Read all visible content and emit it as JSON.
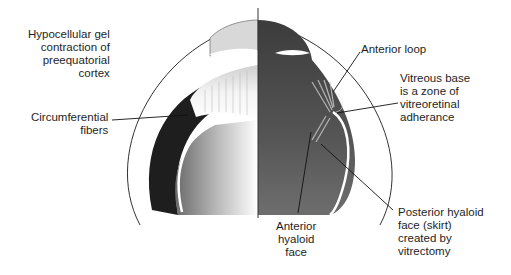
{
  "figure": {
    "colors": {
      "background": "#ffffff",
      "light_half": "#e6e6e6",
      "dark_half": "#4a4a4a",
      "outline": "#333333",
      "leader_line": "#111111"
    }
  },
  "labels": {
    "hypocellular": {
      "lines": [
        "Hypocellular gel",
        "contraction of",
        "preequatorial",
        "cortex"
      ]
    },
    "circumferential": {
      "lines": [
        "Circumferential",
        "fibers"
      ]
    },
    "anterior_loop": {
      "lines": [
        "Anterior loop"
      ]
    },
    "vitreous_base": {
      "lines": [
        "Vitreous base",
        "is a zone of",
        "vitreoretinal",
        "adherance"
      ]
    },
    "anterior_hyaloid": {
      "lines": [
        "Anterior",
        "hyaloid",
        "face"
      ]
    },
    "posterior_hyaloid": {
      "lines": [
        "Posterior hyaloid",
        "face (skirt)",
        "created by",
        "vitrectomy"
      ]
    }
  }
}
